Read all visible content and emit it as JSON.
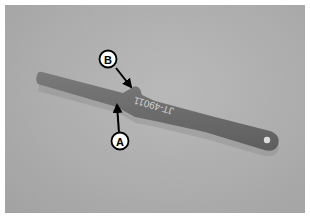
{
  "figure": {
    "tool_marking": "JT-49011",
    "callouts": [
      {
        "label": "A"
      },
      {
        "label": "B"
      }
    ],
    "colors": {
      "background": "#adadad",
      "tool": "#6c6c6c",
      "callout_fill": "#ffffff",
      "callout_stroke": "#000000"
    }
  }
}
